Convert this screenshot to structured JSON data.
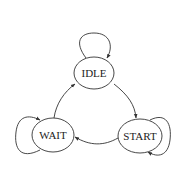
{
  "diagram": {
    "type": "state-machine",
    "nodes": [
      {
        "id": "idle",
        "label": "IDLE"
      },
      {
        "id": "start",
        "label": "START"
      },
      {
        "id": "wait",
        "label": "WAIT"
      }
    ],
    "edges": [
      {
        "from": "IDLE",
        "to": "IDLE"
      },
      {
        "from": "IDLE",
        "to": "START"
      },
      {
        "from": "START",
        "to": "START"
      },
      {
        "from": "START",
        "to": "WAIT"
      },
      {
        "from": "WAIT",
        "to": "WAIT"
      },
      {
        "from": "WAIT",
        "to": "IDLE"
      }
    ],
    "colors": {
      "stroke": "#333333",
      "background": "#ffffff",
      "text": "#222222"
    }
  }
}
